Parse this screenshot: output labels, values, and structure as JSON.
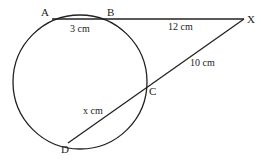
{
  "diagram": {
    "type": "circle-secant-theorem",
    "circle": {
      "cx": 80,
      "cy": 82,
      "r": 67
    },
    "points": {
      "A": {
        "label": "A",
        "x": 52,
        "y": 19
      },
      "B": {
        "label": "B",
        "x": 107,
        "y": 19
      },
      "X": {
        "label": "X",
        "x": 244,
        "y": 19
      },
      "C": {
        "label": "C",
        "x": 147,
        "y": 88
      },
      "D": {
        "label": "D",
        "x": 68,
        "y": 143
      }
    },
    "lengths": {
      "AB": "3 cm",
      "BX": "12 cm",
      "XC": "10 cm",
      "CD": "x cm"
    },
    "colors": {
      "stroke": "#222222",
      "background": "#ffffff"
    }
  }
}
